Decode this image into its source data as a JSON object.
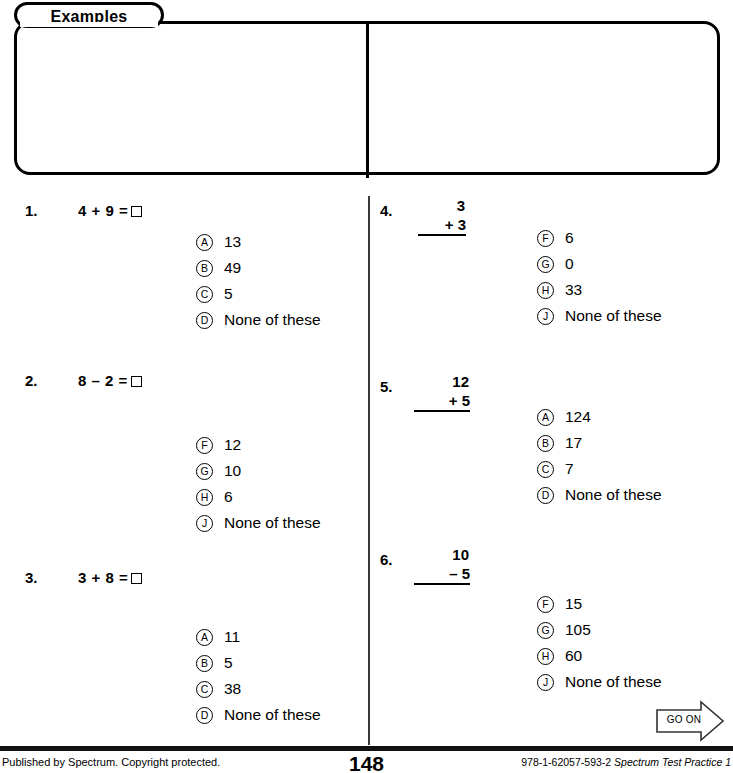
{
  "header": {
    "tab_label": "Examples"
  },
  "examples": [
    {
      "label": "A.",
      "stem_type": "vertical",
      "operand_top": "6",
      "operator": "+",
      "operand_bottom": "4",
      "options": [
        {
          "letter": "A",
          "text": "64"
        },
        {
          "letter": "B",
          "text": "10"
        },
        {
          "letter": "C",
          "text": "2"
        },
        {
          "letter": "D",
          "text": "None of these"
        }
      ]
    },
    {
      "label": "B.",
      "stem_type": "inline",
      "stem": "4 – 1 =",
      "options": [
        {
          "letter": "F",
          "text": "14"
        },
        {
          "letter": "G",
          "text": "5"
        },
        {
          "letter": "H",
          "text": "3"
        },
        {
          "letter": "J",
          "text": "None of these"
        }
      ]
    }
  ],
  "questions": [
    {
      "number": "1.",
      "stem_type": "inline",
      "stem": "4 + 9 =",
      "options": [
        {
          "letter": "A",
          "text": "13"
        },
        {
          "letter": "B",
          "text": "49"
        },
        {
          "letter": "C",
          "text": "5"
        },
        {
          "letter": "D",
          "text": "None of these"
        }
      ]
    },
    {
      "number": "2.",
      "stem_type": "inline",
      "stem": "8 – 2 =",
      "options": [
        {
          "letter": "F",
          "text": "12"
        },
        {
          "letter": "G",
          "text": "10"
        },
        {
          "letter": "H",
          "text": "6"
        },
        {
          "letter": "J",
          "text": "None of these"
        }
      ]
    },
    {
      "number": "3.",
      "stem_type": "inline",
      "stem": "3 + 8 =",
      "options": [
        {
          "letter": "A",
          "text": "11"
        },
        {
          "letter": "B",
          "text": "5"
        },
        {
          "letter": "C",
          "text": "38"
        },
        {
          "letter": "D",
          "text": "None of these"
        }
      ]
    },
    {
      "number": "4.",
      "stem_type": "vertical",
      "operand_top": "3",
      "operator": "+",
      "operand_bottom": "3",
      "options": [
        {
          "letter": "F",
          "text": "6"
        },
        {
          "letter": "G",
          "text": "0"
        },
        {
          "letter": "H",
          "text": "33"
        },
        {
          "letter": "J",
          "text": "None of these"
        }
      ]
    },
    {
      "number": "5.",
      "stem_type": "vertical",
      "operand_top": "12",
      "operator": "+",
      "operand_bottom": "5",
      "options": [
        {
          "letter": "A",
          "text": "124"
        },
        {
          "letter": "B",
          "text": "17"
        },
        {
          "letter": "C",
          "text": "7"
        },
        {
          "letter": "D",
          "text": "None of these"
        }
      ]
    },
    {
      "number": "6.",
      "stem_type": "vertical",
      "operand_top": "10",
      "operator": "–",
      "operand_bottom": "5",
      "options": [
        {
          "letter": "F",
          "text": "15"
        },
        {
          "letter": "G",
          "text": "105"
        },
        {
          "letter": "H",
          "text": "60"
        },
        {
          "letter": "J",
          "text": "None of these"
        }
      ]
    }
  ],
  "go_on": {
    "label": "GO ON"
  },
  "footer": {
    "left": "Published by Spectrum. Copyright protected.",
    "page_number": "148",
    "isbn": "978-1-62057-593-2",
    "book_title": "Spectrum Test Practice 1"
  }
}
